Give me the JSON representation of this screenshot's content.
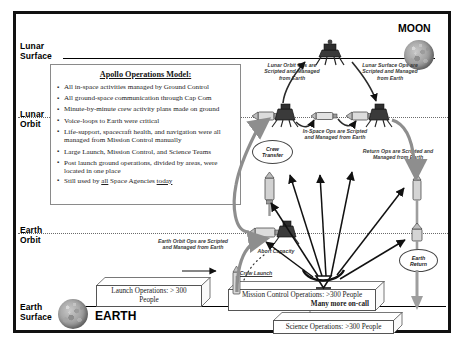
{
  "diagram": {
    "title_moon": "MOON",
    "title_earth": "EARTH"
  },
  "bands": [
    {
      "id": "lunar-surface",
      "line1": "Lunar",
      "line2": "Surface"
    },
    {
      "id": "lunar-orbit",
      "line1": "Lunar",
      "line2": "Orbit"
    },
    {
      "id": "earth-orbit",
      "line1": "Earth",
      "line2": "Orbit"
    },
    {
      "id": "earth-surface",
      "line1": "Earth",
      "line2": "Surface"
    }
  ],
  "ops_model": {
    "title": "Apollo Operations Model:",
    "bullets": [
      "All in-space activities managed by Ground Control",
      "All ground-space communication through Cap Com",
      "Minute-by-minute crew activity plans made on ground",
      "Voice-loops to Earth were critical",
      "Life-support, spacecraft health, and navigation were all managed from Mission Control manually",
      "Large Launch, Mission Control, and Science Teams",
      "Post launch ground operations, divided by areas, were located in one place"
    ],
    "last_bullet": {
      "pre": "Still used by ",
      "u1": "all",
      "mid": " Space Agencies ",
      "u2": "today"
    }
  },
  "notes": {
    "lunar_orbit_ops": "Lunar Orbit Ops are Scripted and Managed from Earth",
    "lunar_surface_ops": "Lunar Surface Ops are Scripted and Managed from Earth",
    "in_space_ops": "In-Space Ops are Scripted and Managed from Earth",
    "return_ops": "Return Ops are Scripted and Managed from Earth",
    "earth_orbit_ops": "Earth Orbit Ops are Scripted and Managed from Earth",
    "abort_capacity": "Abort Capacity",
    "crew_launch": "Crew Launch"
  },
  "ovals": [
    {
      "id": "crew-transfer",
      "line1": "Crew",
      "line2": "Transfer"
    },
    {
      "id": "earth-return",
      "line1": "Earth",
      "line2": "Return"
    }
  ],
  "boxes": {
    "launch_ops": {
      "line1": "Launch Operations:  > 300",
      "line2": "People"
    },
    "mission_control": {
      "line1": "Mission Control Operations:   >300 People",
      "line2": "Many more on-call"
    },
    "science_ops": {
      "line1": "Science Operations:   >300 People"
    }
  },
  "colors": {
    "frame": "#111111",
    "rule": "#000000",
    "dotted_rule": "#6a6a6a",
    "note_text": "#3a3a3a",
    "spacecraft": "#707070",
    "arrow": "#111111"
  }
}
